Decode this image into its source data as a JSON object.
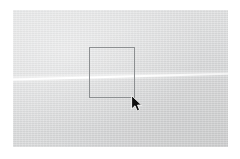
{
  "screen": {
    "width": 240,
    "height": 159,
    "page_background": "#ffffff"
  },
  "canvas": {
    "name": "photo-canvas",
    "background_color": "#d9dadb",
    "x": 13,
    "y": 10,
    "width": 215,
    "height": 137,
    "description": "Light gray textured photographic surface"
  },
  "horizon": {
    "name": "horizon-line",
    "color": "#ffffff",
    "angle_degrees": -1.55,
    "left_y": 79,
    "right_y": 73,
    "thickness": 2
  },
  "selection": {
    "name": "selection-rectangle",
    "border_color": "#8c8f91",
    "border_width": 1,
    "x": 89,
    "y": 47,
    "width": 46,
    "height": 51,
    "right": 135,
    "bottom": 98
  },
  "cursor": {
    "name": "mouse-cursor",
    "icon": "arrow-pointer-icon",
    "color": "#101010",
    "outline_color": "#ffffff",
    "x": 134,
    "y": 98
  }
}
